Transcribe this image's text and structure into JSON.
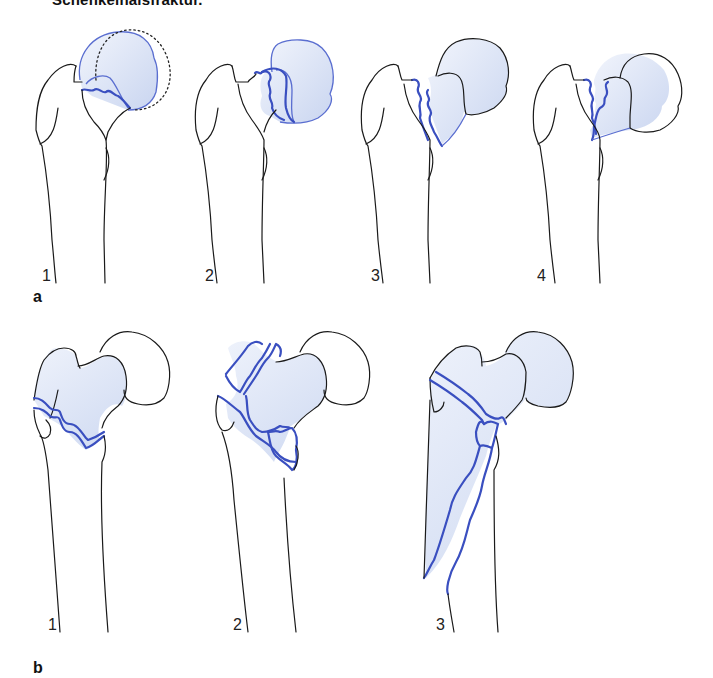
{
  "caption": "Schenkelhalsfraktur.",
  "colors": {
    "fracture_line": "#3a4fc0",
    "fragment_fill": "#dde6f7",
    "outline": "#1a1a1a"
  },
  "panels": [
    {
      "label": "a",
      "figures": [
        {
          "number": "1"
        },
        {
          "number": "2"
        },
        {
          "number": "3"
        },
        {
          "number": "4"
        }
      ]
    },
    {
      "label": "b",
      "figures": [
        {
          "number": "1"
        },
        {
          "number": "2"
        },
        {
          "number": "3"
        }
      ]
    }
  ]
}
